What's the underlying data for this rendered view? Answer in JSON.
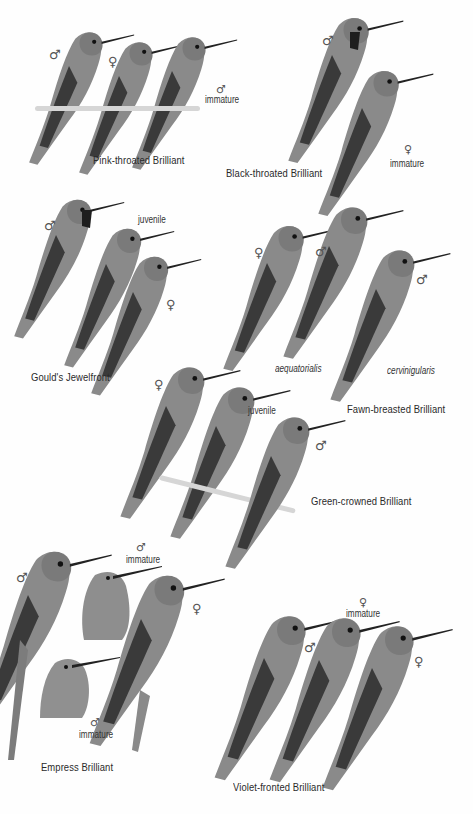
{
  "plate": {
    "background": "#fefefe",
    "species": [
      {
        "name": "Pink-throated Brilliant",
        "birds": [
          {
            "sex_symbol": "♂",
            "note": ""
          },
          {
            "sex_symbol": "♀",
            "note": ""
          },
          {
            "sex_symbol": "♂",
            "note": "immature"
          }
        ]
      },
      {
        "name": "Black-throated Brilliant",
        "birds": [
          {
            "sex_symbol": "♂",
            "note": ""
          },
          {
            "sex_symbol": "♀",
            "note": "immature"
          }
        ]
      },
      {
        "name": "Gould's Jewelfront",
        "birds": [
          {
            "sex_symbol": "♂",
            "note": ""
          },
          {
            "sex_symbol": "",
            "note": "juvenile"
          },
          {
            "sex_symbol": "♀",
            "note": ""
          }
        ]
      },
      {
        "name": "Fawn-breasted Brilliant",
        "birds": [
          {
            "sex_symbol": "♀",
            "note": ""
          },
          {
            "sex_symbol": "♂",
            "note": "aequatorialis"
          },
          {
            "sex_symbol": "♂",
            "note": "cervinigularis"
          }
        ]
      },
      {
        "name": "Green-crowned Brilliant",
        "birds": [
          {
            "sex_symbol": "♀",
            "note": ""
          },
          {
            "sex_symbol": "",
            "note": "juvenile"
          },
          {
            "sex_symbol": "♂",
            "note": ""
          }
        ]
      },
      {
        "name": "Empress Brilliant",
        "birds": [
          {
            "sex_symbol": "♂",
            "note": ""
          },
          {
            "sex_symbol": "♂",
            "note": "immature"
          },
          {
            "sex_symbol": "♂",
            "note": "immature"
          },
          {
            "sex_symbol": "♀",
            "note": ""
          }
        ]
      },
      {
        "name": "Violet-fronted Brilliant",
        "birds": [
          {
            "sex_symbol": "♂",
            "note": ""
          },
          {
            "sex_symbol": "♀",
            "note": "immature"
          },
          {
            "sex_symbol": "♀",
            "note": ""
          }
        ]
      }
    ]
  }
}
